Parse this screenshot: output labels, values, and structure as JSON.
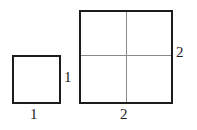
{
  "figure": {
    "background_color": "#ffffff",
    "outline_color": "#1c1c1c",
    "divider_color": "#8a8a8a",
    "label_color": "#1c1c1c",
    "shapes": [
      {
        "name": "small-square",
        "side_label_right": "1",
        "side_label_bottom": "1",
        "subdivisions": 1
      },
      {
        "name": "large-square",
        "side_label_right": "2",
        "side_label_bottom": "2",
        "subdivisions": 4
      }
    ],
    "labels": {
      "small_right": "1",
      "small_bottom": "1",
      "large_right": "2",
      "large_bottom": "2"
    }
  }
}
